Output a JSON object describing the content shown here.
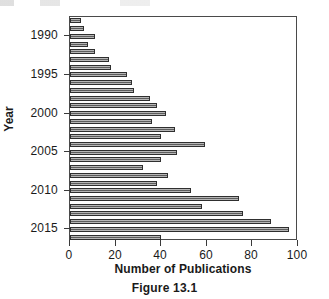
{
  "caption": "Figure 13.1",
  "chart_data": {
    "type": "bar",
    "orientation": "horizontal",
    "title": "",
    "xlabel": "Number of Publications",
    "ylabel": "Year",
    "xlim": [
      0,
      100
    ],
    "xticks": [
      0,
      20,
      40,
      60,
      80,
      100
    ],
    "xtick_labels": [
      "0",
      "20",
      "40",
      "60",
      "80",
      "100"
    ],
    "yticks": [
      1990,
      1995,
      2000,
      2005,
      2010,
      2015
    ],
    "ytick_labels": [
      "1990",
      "1995",
      "2000",
      "2005",
      "2010",
      "2015"
    ],
    "grid": false,
    "legend": null,
    "bar_color": "#5d5d5d",
    "bar_edge_color": "#2f2f2f",
    "categories": [
      "1988",
      "1989",
      "1990",
      "1991",
      "1992",
      "1993",
      "1994",
      "1995",
      "1996",
      "1997",
      "1998",
      "1999",
      "2000",
      "2001",
      "2002",
      "2003",
      "2004",
      "2005",
      "2006",
      "2007",
      "2008",
      "2009",
      "2010",
      "2011",
      "2012",
      "2013",
      "2014",
      "2015",
      "2016"
    ],
    "values": [
      5,
      6,
      11,
      8,
      11,
      17,
      18,
      25,
      27,
      28,
      35,
      38,
      42,
      36,
      46,
      40,
      59,
      47,
      40,
      32,
      43,
      38,
      53,
      74,
      58,
      76,
      88,
      96,
      40
    ]
  }
}
